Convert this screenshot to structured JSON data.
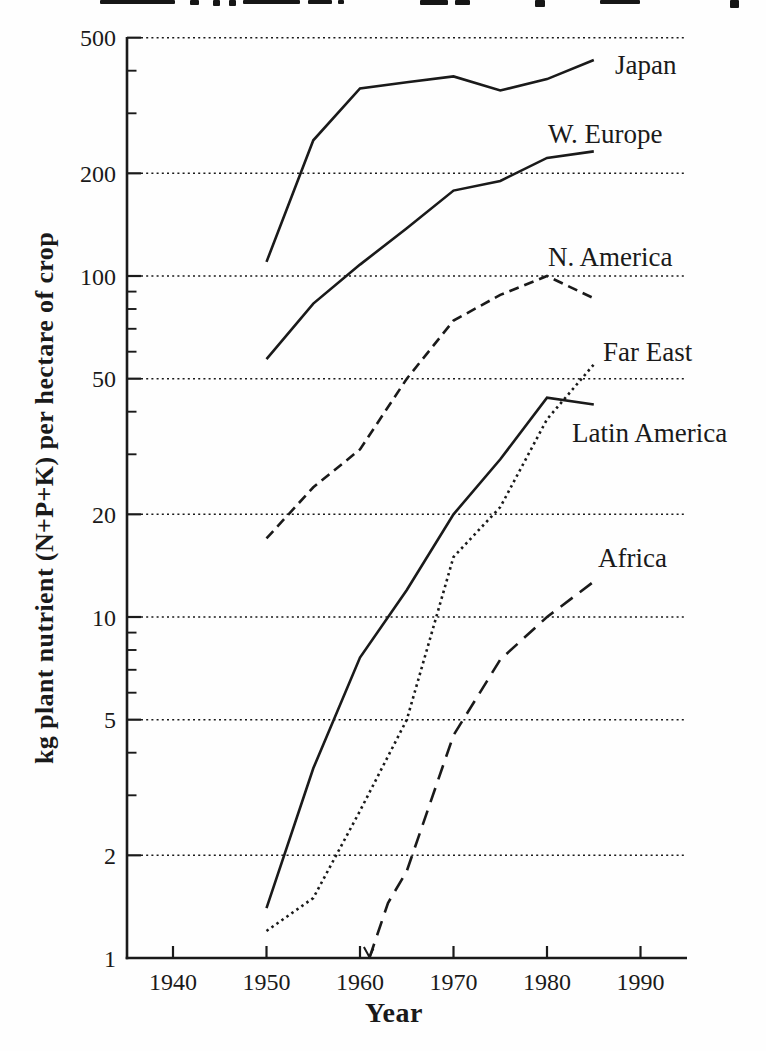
{
  "colors": {
    "ink": "#1a1a1a",
    "background": "#fefefe"
  },
  "figure": {
    "x_axis_title": "Year",
    "y_axis_title": "kg plant nutrient (N+P+K) per hectare of crop"
  },
  "chart_data": {
    "type": "line",
    "title": "",
    "x_axis": {
      "label": "Year",
      "ticks": [
        1940,
        1950,
        1960,
        1970,
        1980,
        1990
      ],
      "range": [
        1935,
        1995
      ],
      "grid": false
    },
    "y_axis": {
      "label": "kg plant nutrient (N+P+K) per hectare of crop",
      "scale": "log",
      "ticks": [
        500,
        200,
        100,
        50,
        20,
        10,
        5,
        2,
        1
      ],
      "minor_ticks": [
        300,
        400,
        30,
        40,
        60,
        70,
        80,
        90,
        3,
        4,
        6,
        7,
        8,
        9
      ],
      "gridline_values": [
        500,
        200,
        100,
        50,
        20,
        10,
        5,
        2
      ],
      "range": [
        1,
        500
      ],
      "grid": "dotted-horizontal"
    },
    "legend_position": "inline-labels-right",
    "series": [
      {
        "name": "Japan",
        "line_style": "solid",
        "points": [
          [
            1950,
            110
          ],
          [
            1955,
            250
          ],
          [
            1960,
            355
          ],
          [
            1965,
            370
          ],
          [
            1970,
            385
          ],
          [
            1975,
            350
          ],
          [
            1980,
            378
          ],
          [
            1985,
            430
          ]
        ]
      },
      {
        "name": "W. Europe",
        "line_style": "solid",
        "points": [
          [
            1950,
            57
          ],
          [
            1955,
            83
          ],
          [
            1960,
            108
          ],
          [
            1965,
            138
          ],
          [
            1970,
            178
          ],
          [
            1975,
            190
          ],
          [
            1980,
            222
          ],
          [
            1985,
            232
          ]
        ]
      },
      {
        "name": "N. America",
        "line_style": "dashed",
        "points": [
          [
            1950,
            17
          ],
          [
            1955,
            24
          ],
          [
            1960,
            31
          ],
          [
            1965,
            50
          ],
          [
            1970,
            74
          ],
          [
            1975,
            88
          ],
          [
            1980,
            100
          ],
          [
            1985,
            86
          ]
        ]
      },
      {
        "name": "Far East",
        "line_style": "dotted",
        "points": [
          [
            1950,
            1.2
          ],
          [
            1955,
            1.5
          ],
          [
            1960,
            2.7
          ],
          [
            1965,
            5
          ],
          [
            1970,
            15
          ],
          [
            1975,
            21
          ],
          [
            1980,
            38
          ],
          [
            1985,
            55
          ]
        ]
      },
      {
        "name": "Latin America",
        "line_style": "solid",
        "points": [
          [
            1950,
            1.4
          ],
          [
            1955,
            3.6
          ],
          [
            1960,
            7.6
          ],
          [
            1965,
            12
          ],
          [
            1970,
            20
          ],
          [
            1975,
            29
          ],
          [
            1980,
            44
          ],
          [
            1985,
            42
          ]
        ]
      },
      {
        "name": "Africa",
        "line_style": "long-dash",
        "start_arrow": true,
        "points": [
          [
            1961,
            1.0
          ],
          [
            1963,
            1.45
          ],
          [
            1965,
            1.8
          ],
          [
            1970,
            4.5
          ],
          [
            1975,
            7.5
          ],
          [
            1980,
            10
          ],
          [
            1985,
            12.7
          ]
        ]
      }
    ]
  },
  "artifacts": {
    "top_text_fragments": [
      [
        100,
        75,
        4
      ],
      [
        190,
        9,
        5
      ],
      [
        213,
        7,
        6
      ],
      [
        229,
        7,
        6
      ],
      [
        243,
        57,
        4
      ],
      [
        308,
        24,
        4
      ],
      [
        338,
        6,
        4
      ],
      [
        420,
        28,
        5
      ],
      [
        455,
        15,
        5
      ],
      [
        535,
        10,
        7
      ],
      [
        600,
        40,
        4
      ],
      [
        730,
        9,
        8
      ]
    ]
  }
}
